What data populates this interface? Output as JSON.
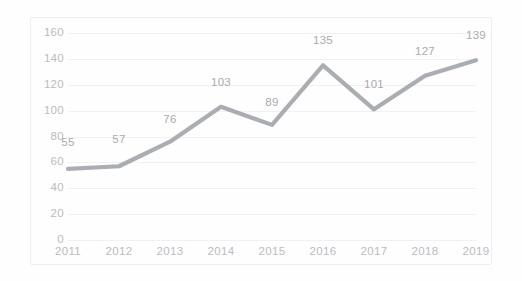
{
  "chart_data": {
    "type": "line",
    "title": "",
    "subtitle": "",
    "xlabel": "",
    "ylabel": "",
    "categories": [
      "2011",
      "2012",
      "2013",
      "2014",
      "2015",
      "2016",
      "2017",
      "2018",
      "2019"
    ],
    "values": [
      55,
      57,
      76,
      103,
      89,
      135,
      101,
      127,
      139
    ],
    "data_labels": [
      "55",
      "57",
      "76",
      "103",
      "89",
      "135",
      "101",
      "127",
      "139"
    ],
    "ylim": [
      0,
      160
    ],
    "ytick_labels": [
      "0",
      "20",
      "40",
      "60",
      "80",
      "100",
      "120",
      "140",
      "160"
    ],
    "ytick_values": [
      0,
      20,
      40,
      60,
      80,
      100,
      120,
      140,
      160
    ],
    "grid": true,
    "grid_axis": "y",
    "legend": false,
    "legend_position": "none",
    "series": [
      {
        "name": "",
        "values": [
          55,
          57,
          76,
          103,
          89,
          135,
          101,
          127,
          139
        ]
      }
    ],
    "colors": {
      "line": "#a3a6aa",
      "gridline": "#f0f1f2",
      "tick_text": "#b9bcc0",
      "data_label_text": "#a8abaf",
      "border": "#eceef0",
      "background": "#fefefe"
    }
  }
}
